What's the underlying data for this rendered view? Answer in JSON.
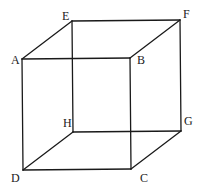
{
  "diagram": {
    "vertices": {
      "A": {
        "label": "A",
        "x": 22,
        "y": 59,
        "lx": 11,
        "ly": 64
      },
      "B": {
        "label": "B",
        "x": 130,
        "y": 58,
        "lx": 137,
        "ly": 64
      },
      "C": {
        "label": "C",
        "x": 131,
        "y": 169,
        "lx": 140,
        "ly": 182
      },
      "D": {
        "label": "D",
        "x": 23,
        "y": 170,
        "lx": 11,
        "ly": 182
      },
      "E": {
        "label": "E",
        "x": 72,
        "y": 21,
        "lx": 62,
        "ly": 20
      },
      "F": {
        "label": "F",
        "x": 180,
        "y": 20,
        "lx": 183,
        "ly": 18
      },
      "G": {
        "label": "G",
        "x": 181,
        "y": 131,
        "lx": 184,
        "ly": 125
      },
      "H": {
        "label": "H",
        "x": 73,
        "y": 132,
        "lx": 63,
        "ly": 127
      }
    },
    "edges": [
      [
        "A",
        "B"
      ],
      [
        "B",
        "C"
      ],
      [
        "C",
        "D"
      ],
      [
        "D",
        "A"
      ],
      [
        "E",
        "F"
      ],
      [
        "F",
        "G"
      ],
      [
        "G",
        "H"
      ],
      [
        "H",
        "E"
      ],
      [
        "A",
        "E"
      ],
      [
        "B",
        "F"
      ],
      [
        "C",
        "G"
      ],
      [
        "D",
        "H"
      ]
    ],
    "colors": {
      "line": "#1a1a1a",
      "background": "#ffffff"
    }
  }
}
